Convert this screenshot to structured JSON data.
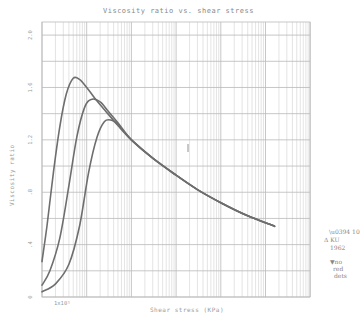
{
  "chart_data": {
    "type": "line",
    "title": "Viscosity ratio vs. shear stress",
    "xlabel": "Shear stress (KPa)",
    "ylabel": "Viscosity ratio",
    "xscale": "log",
    "xlim": [
      10,
      2000000
    ],
    "ylim": [
      0,
      2.1
    ],
    "x_tick_labels": [
      "1x10¹"
    ],
    "y_ticks": [
      0,
      0.4,
      0.8,
      1.2,
      1.6,
      2.0
    ],
    "y_tick_labels": [
      "0",
      ".4",
      ".8",
      "1.2",
      "1.6",
      "2.0"
    ],
    "grid": true,
    "series": [
      {
        "name": "curve-1",
        "x": [
          10,
          13,
          18,
          25,
          35,
          50,
          70,
          100,
          150,
          250,
          500,
          1000,
          3000,
          10000,
          30000,
          100000,
          400000,
          1600000
        ],
        "y": [
          0.27,
          0.55,
          0.95,
          1.3,
          1.55,
          1.67,
          1.66,
          1.6,
          1.52,
          1.43,
          1.31,
          1.2,
          1.06,
          0.93,
          0.82,
          0.72,
          0.62,
          0.54
        ]
      },
      {
        "name": "curve-2",
        "x": [
          10,
          15,
          25,
          40,
          60,
          90,
          130,
          200,
          300,
          500,
          1000,
          3000,
          10000,
          30000,
          100000,
          400000,
          1600000
        ],
        "y": [
          0.09,
          0.2,
          0.45,
          0.85,
          1.22,
          1.45,
          1.51,
          1.49,
          1.42,
          1.33,
          1.2,
          1.06,
          0.93,
          0.82,
          0.72,
          0.62,
          0.54
        ]
      },
      {
        "name": "curve-3",
        "x": [
          10,
          20,
          40,
          70,
          110,
          170,
          250,
          360,
          500,
          700,
          1000,
          3000,
          10000,
          30000,
          100000,
          400000,
          1600000
        ],
        "y": [
          0.04,
          0.1,
          0.25,
          0.55,
          0.95,
          1.22,
          1.34,
          1.35,
          1.32,
          1.26,
          1.2,
          1.06,
          0.93,
          0.82,
          0.72,
          0.62,
          0.54
        ]
      }
    ],
    "annotations": [
      "handwritten notes at right margin (illegible)"
    ]
  }
}
